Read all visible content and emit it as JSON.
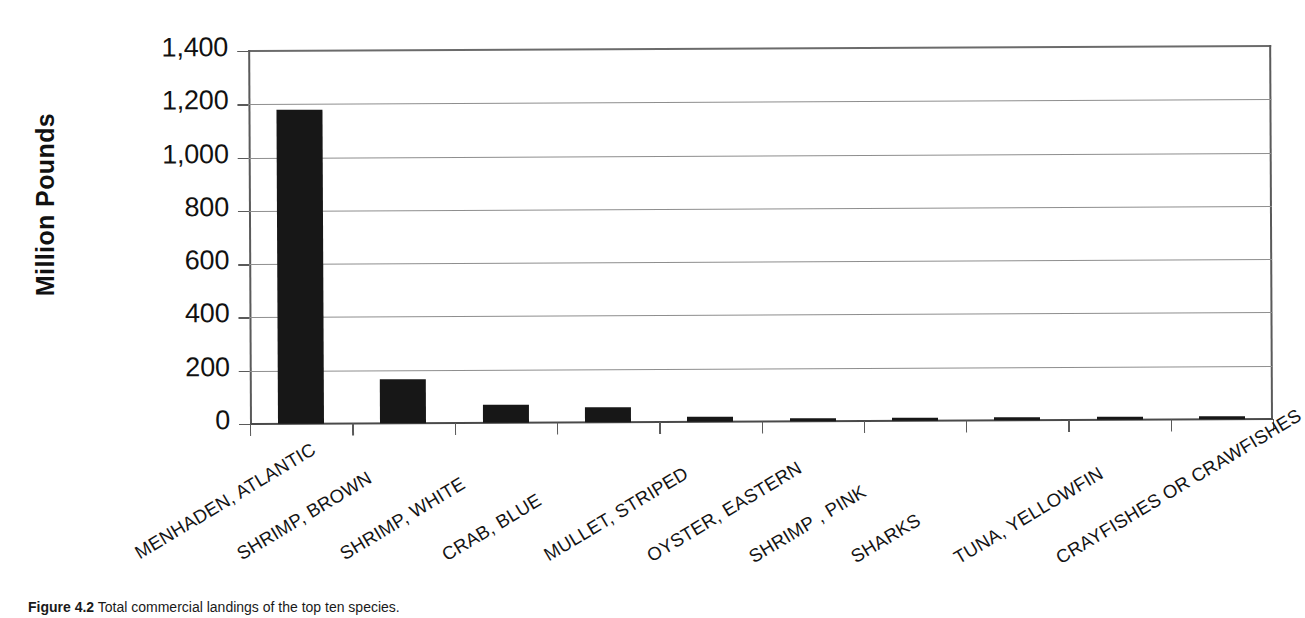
{
  "chart_data": {
    "type": "bar",
    "title": "",
    "xlabel": "",
    "ylabel": "Million Pounds",
    "ylim": [
      0,
      1400
    ],
    "ytick_values": [
      0,
      200,
      400,
      600,
      800,
      1000,
      1200,
      1400
    ],
    "ytick_labels": [
      "0",
      "200",
      "400",
      "600",
      "800",
      "1,000",
      "1,200",
      "1,400"
    ],
    "grid": true,
    "legend": "none",
    "bar_color": "#171717",
    "categories": [
      "MENHADEN, ATLANTIC",
      "SHRIMP, BROWN",
      "SHRIMP, WHITE",
      "CRAB, BLUE",
      "MULLET, STRIPED",
      "OYSTER, EASTERN",
      "SHRIMP , PINK",
      "SHARKS",
      "TUNA, YELLOWFIN",
      "CRAYFISHES OR CRAWFISHES"
    ],
    "values": [
      1180,
      167,
      66,
      55,
      18,
      9,
      8,
      12,
      11,
      10
    ]
  },
  "caption": {
    "label": "Figure 4.2",
    "text": " Total commercial landings of the top ten species."
  }
}
